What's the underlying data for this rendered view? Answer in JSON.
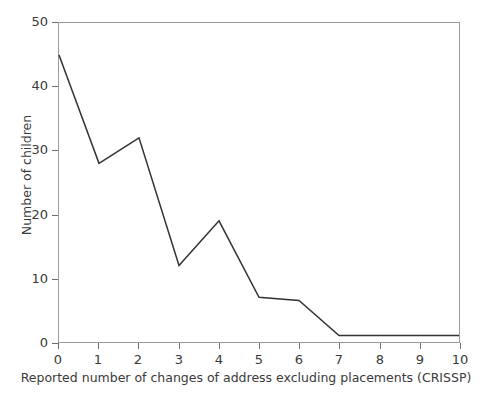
{
  "chart_data": {
    "type": "line",
    "title": "",
    "subtitle": "",
    "xlabel": "Reported number of changes of address excluding placements (CRISSP)",
    "ylabel": "Number of children",
    "x": [
      0,
      1,
      2,
      3,
      4,
      5,
      6,
      7,
      8,
      9,
      10
    ],
    "values": [
      45,
      28,
      32,
      12,
      19,
      7,
      6.5,
      1,
      1,
      1,
      1
    ],
    "series": [
      {
        "name": "Number of children",
        "values": [
          45,
          28,
          32,
          12,
          19,
          7,
          6.5,
          1,
          1,
          1,
          1
        ]
      }
    ],
    "xlim": [
      0,
      10
    ],
    "ylim": [
      0,
      50
    ],
    "xticks": [
      "0",
      "1",
      "2",
      "3",
      "4",
      "5",
      "6",
      "7",
      "8",
      "9",
      "10"
    ],
    "yticks": [
      "0",
      "10",
      "20",
      "30",
      "40",
      "50"
    ],
    "ytick_values": [
      0,
      10,
      20,
      30,
      40,
      50
    ],
    "xtick_values": [
      0,
      1,
      2,
      3,
      4,
      5,
      6,
      7,
      8,
      9,
      10
    ],
    "grid": false,
    "legend": false,
    "legend_position": "none",
    "annotations": [],
    "colors": {
      "line": "#333333",
      "axis": "#9a9a9a",
      "tick": "#6e6e6e",
      "text": "#3a3a3a",
      "background": "#ffffff"
    }
  }
}
